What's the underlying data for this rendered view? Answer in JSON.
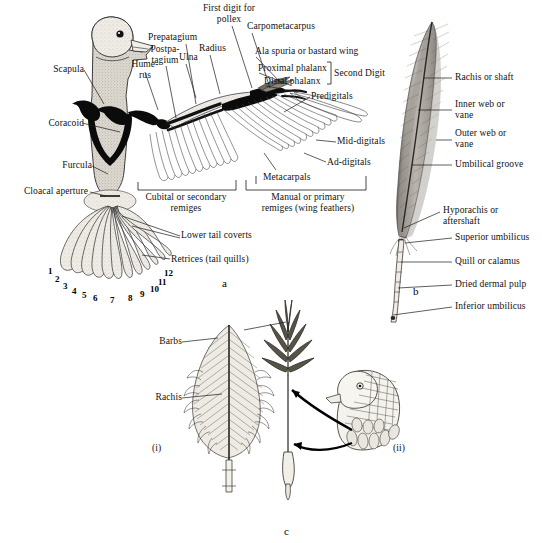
{
  "figure": {
    "title_internal": "Bird wing and feather anatomy plate",
    "panels": [
      {
        "id": "a",
        "letter": "a"
      },
      {
        "id": "b",
        "letter": "b"
      },
      {
        "id": "c",
        "letter": "c"
      }
    ]
  },
  "panel_a": {
    "letter": "a",
    "labels": {
      "scapula": "Scapula",
      "coracoid": "Coracoid",
      "furcula": "Furcula",
      "cloacal_aperture": "Cloacal aperture",
      "humerus": "Hume-\nrus",
      "postpatagium": "Postpa-\ntagium",
      "prepatagium": "Prepatagium",
      "ulna": "Ulna",
      "radius": "Radius",
      "first_digit": "First digit for\npollex",
      "carpometacarpus": "Carpometacarpus",
      "ala_spuria": "Ala spuria or bastard wing",
      "proximal_phalanx": "Proximal phalanx",
      "distal_phalanx": "Distal phalanx",
      "second_digit": "Second Digit",
      "predigitals": "Predigitals",
      "mid_digitals": "Mid-digitals",
      "ad_digitals": "Ad-digitals",
      "metacarpals": "Metacarpals",
      "lower_tail_coverts": "Lower tail coverts",
      "retrices": "Retrices (tail quills)"
    },
    "brackets": {
      "cubital": "Cubital or secondary\nremiges",
      "manual": "Manual or primary\nremiges (wing feathers)"
    },
    "tail_feather_numbers": [
      "1",
      "2",
      "3",
      "4",
      "5",
      "6",
      "7",
      "8",
      "9",
      "10",
      "11",
      "12"
    ]
  },
  "panel_b": {
    "letter": "b",
    "labels": [
      "Rachis or shaft",
      "Inner web or\nvane",
      "Outer web or\nvane",
      "Umbilical groove",
      "Hyporachis or\naftershaft",
      "Superior umbilicus",
      "Quill or calamus",
      "Dried dermal pulp",
      "Inferior umbilicus"
    ]
  },
  "panel_c": {
    "letter": "c",
    "labels": {
      "barbs": "Barbs",
      "rachis": "Rachis"
    },
    "subpanels": [
      {
        "id": "i",
        "label": "(i)"
      },
      {
        "id": "ii",
        "label": "(ii)"
      }
    ]
  },
  "colors": {
    "ink": "#111111",
    "body_fill": "#d8d4ca",
    "bone_dark": "#0d0d0d",
    "feather_gray": "#8f8b84",
    "paper": "#ffffff"
  }
}
